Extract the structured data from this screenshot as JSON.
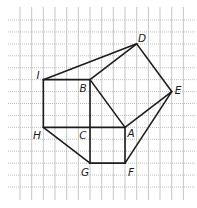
{
  "diagram": {
    "type": "geometry-grid-figure",
    "grid": {
      "columns": 15,
      "rows": 15,
      "origin_px": [
        20,
        20
      ],
      "cell_w_px": 11.67,
      "cell_h_px": 11.93,
      "h_line_extent_px": [
        8,
        195
      ],
      "v_line_extent_px": [
        7,
        200
      ],
      "line_color": "#b8b8b8"
    },
    "stroke_color": "#1c1c1c",
    "points": {
      "A": [
        9,
        9
      ],
      "B": [
        6,
        5
      ],
      "C": [
        6,
        9
      ],
      "D": [
        10,
        2
      ],
      "E": [
        13,
        6
      ],
      "F": [
        9,
        12
      ],
      "G": [
        6,
        12
      ],
      "H": [
        2,
        9
      ],
      "I": [
        2,
        5
      ]
    },
    "edges": [
      [
        "I",
        "D"
      ],
      [
        "B",
        "D"
      ],
      [
        "D",
        "E"
      ],
      [
        "E",
        "A"
      ],
      [
        "A",
        "B"
      ],
      [
        "I",
        "B"
      ],
      [
        "I",
        "H"
      ],
      [
        "H",
        "A"
      ],
      [
        "B",
        "G"
      ],
      [
        "A",
        "F"
      ],
      [
        "F",
        "G"
      ],
      [
        "H",
        "G"
      ],
      [
        "E",
        "F"
      ]
    ],
    "labels": [
      {
        "text": "D",
        "x": 142,
        "y": 38
      },
      {
        "text": "I",
        "x": 38,
        "y": 75
      },
      {
        "text": "B",
        "x": 83,
        "y": 88
      },
      {
        "text": "E",
        "x": 178,
        "y": 90
      },
      {
        "text": "H",
        "x": 37,
        "y": 135
      },
      {
        "text": "C",
        "x": 83,
        "y": 135
      },
      {
        "text": "A",
        "x": 131,
        "y": 133
      },
      {
        "text": "G",
        "x": 85,
        "y": 172
      },
      {
        "text": "F",
        "x": 131,
        "y": 172
      }
    ]
  }
}
